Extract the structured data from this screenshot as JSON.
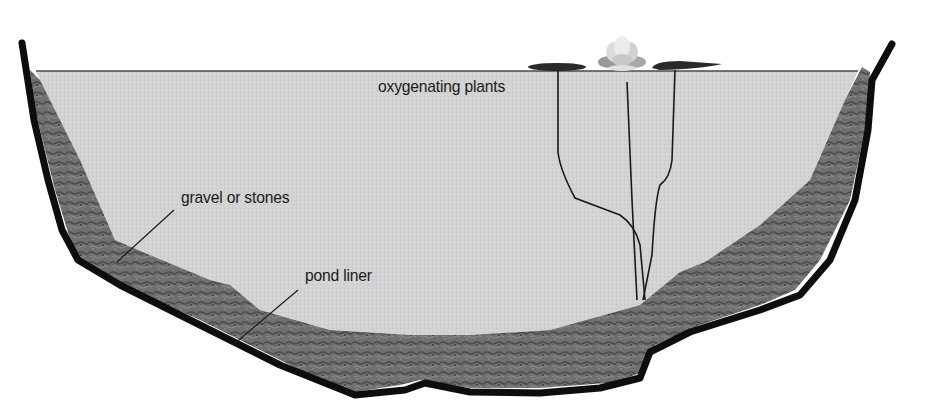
{
  "diagram": {
    "type": "cross-section",
    "labels": {
      "oxygenating_plants": "oxygenating plants",
      "gravel": "gravel or stones",
      "pond_liner": "pond liner"
    },
    "colors": {
      "background": "#ffffff",
      "water": "#d4d4d4",
      "gravel": "#6e6e6e",
      "gravel_dark": "#4a4a4a",
      "liner": "#0d0d0d",
      "stems": "#1a1a1a",
      "lily_pad": "#2a2a2a",
      "flower": "#e6e6e6",
      "label_text": "#1a1a1a"
    },
    "components": [
      {
        "id": "water",
        "name": "water"
      },
      {
        "id": "gravel-layer",
        "name": "gravel or stones"
      },
      {
        "id": "liner",
        "name": "pond liner"
      },
      {
        "id": "water-lily",
        "name": "water lily with pads"
      },
      {
        "id": "stems",
        "name": "oxygenating plant stems"
      }
    ]
  }
}
